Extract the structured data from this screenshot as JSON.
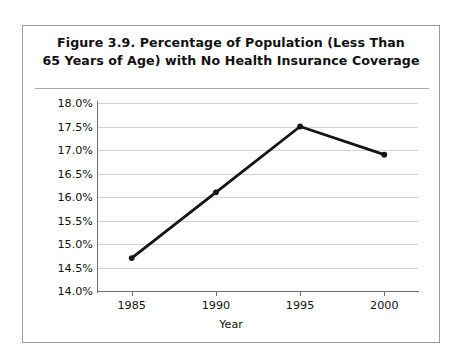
{
  "figure": {
    "title_line1": "Figure 3.9.  Percentage of Population (Less Than",
    "title_line2": "65 Years of Age) with No Health Insurance Coverage"
  },
  "chart_data": {
    "type": "line",
    "title": "Figure 3.9.  Percentage of Population (Less Than 65 Years of Age) with No Health Insurance Coverage",
    "xlabel": "Year",
    "ylabel": "",
    "x": [
      1985,
      1990,
      1995,
      2000
    ],
    "categories": [
      "1985",
      "1990",
      "1995",
      "2000"
    ],
    "values": [
      14.7,
      16.1,
      17.5,
      16.9
    ],
    "value_labels": [
      "14.7%",
      "16.1%",
      "17.5%",
      "16.9%"
    ],
    "series": [
      {
        "name": "Percentage with no health insurance coverage",
        "values": [
          14.7,
          16.1,
          17.5,
          16.9
        ]
      }
    ],
    "ylim": [
      14.0,
      18.0
    ],
    "ytick_values": [
      18.0,
      17.5,
      17.0,
      16.5,
      16.0,
      15.5,
      15.0,
      14.5,
      14.0
    ],
    "ytick_labels": [
      "18.0%",
      "17.5%",
      "17.0%",
      "16.5%",
      "16.0%",
      "15.5%",
      "15.0%",
      "14.5%",
      "14.0%"
    ],
    "xtick_labels": [
      "1985",
      "1990",
      "1995",
      "2000"
    ],
    "xlim": [
      1983,
      2002
    ],
    "grid": "horizontal",
    "legend": "none",
    "line_color": "#141414",
    "marker": "circle",
    "grid_color": "#d2d2d2",
    "axis_color": "#6e6e6e"
  }
}
